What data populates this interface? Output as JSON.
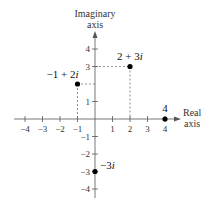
{
  "chart_data": {
    "type": "scatter",
    "title": "",
    "xlabel": "Real axis",
    "ylabel": "Imaginary axis",
    "xlim": [
      -4,
      4
    ],
    "ylim": [
      -4,
      4
    ],
    "grid": false,
    "x_ticks": [
      "−4",
      "−3",
      "−2",
      "−1",
      "1",
      "2",
      "3",
      "4"
    ],
    "y_ticks": [
      "4",
      "3",
      "1",
      "−1",
      "−2",
      "−3",
      "−4"
    ],
    "points": [
      {
        "label": "2 + 3i",
        "re": 2,
        "im": 3,
        "guides": true
      },
      {
        "label": "−1 + 2i",
        "re": -1,
        "im": 2,
        "guides": true
      },
      {
        "label": "4",
        "re": 4,
        "im": 0,
        "guides": false
      },
      {
        "label": "−3i",
        "re": 0,
        "im": -3,
        "guides": false
      }
    ]
  },
  "axes": {
    "real_title_line1": "Real",
    "real_title_line2": "axis",
    "imag_title_line1": "Imaginary",
    "imag_title_line2": "axis"
  },
  "colors": {
    "axis": "#555555",
    "point": "#000000",
    "guide": "#666666",
    "text": "#222222"
  }
}
